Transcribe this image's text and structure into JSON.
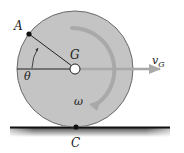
{
  "diagram": {
    "labels": {
      "point_a": "A",
      "center": "G",
      "angle": "θ",
      "velocity": "v",
      "velocity_sub": "G",
      "angular_velocity": "ω",
      "contact": "C"
    },
    "colors": {
      "disk_fill": "#c4c4c4",
      "disk_edge": "#6a6a6a",
      "inner_ring": "#b6b6b6",
      "arrow_gray": "#a9a9a9",
      "ground": "#111111",
      "text": "#222222"
    }
  }
}
